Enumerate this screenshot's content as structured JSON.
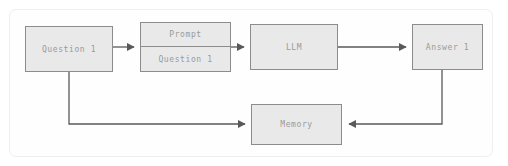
{
  "diagram": {
    "background_color": "#ffffff",
    "frame_border_color": "#eceeef",
    "node_fill_color": "#e9e9e9",
    "node_border_color": "#8c8c8c",
    "node_text_color": "#9a9a9a",
    "edge_color": "#595959",
    "nodes": [
      {
        "id": "question1",
        "label": "Question 1"
      },
      {
        "id": "prompt",
        "label_top": "Prompt",
        "label_bottom": "Question 1"
      },
      {
        "id": "llm",
        "label": "LLM"
      },
      {
        "id": "answer1",
        "label": "Answer 1"
      },
      {
        "id": "memory",
        "label": "Memory"
      }
    ],
    "edges": [
      {
        "id": "question1-to-prompt",
        "from": "question1",
        "to": "prompt"
      },
      {
        "id": "prompt-to-llm",
        "from": "prompt",
        "to": "llm"
      },
      {
        "id": "llm-to-answer1",
        "from": "llm",
        "to": "answer1"
      },
      {
        "id": "question1-to-memory",
        "from": "question1",
        "to": "memory"
      },
      {
        "id": "answer1-to-memory",
        "from": "answer1",
        "to": "memory"
      }
    ]
  }
}
